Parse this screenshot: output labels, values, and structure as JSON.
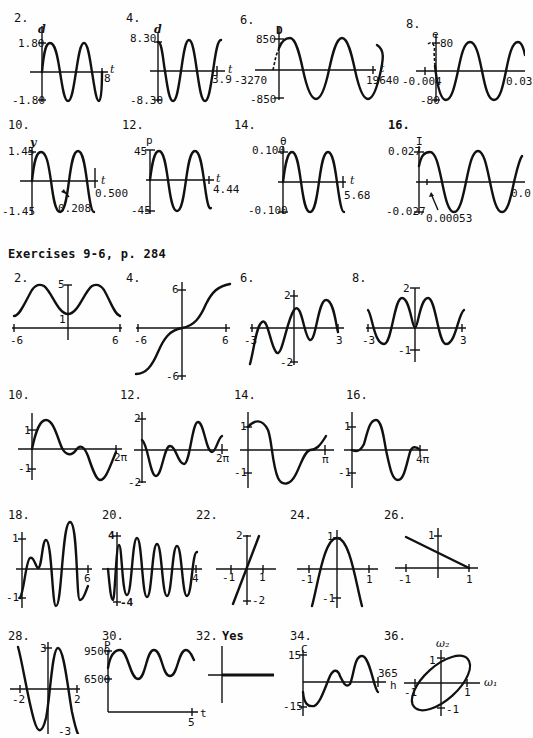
{
  "section_title": "Exercises 9-6, p. 284",
  "top_group": [
    {
      "num": "2.",
      "yvar": "d",
      "xvar": "t",
      "ymax": "1.80",
      "ymin": "-1.80",
      "xmax": "8"
    },
    {
      "num": "4.",
      "yvar": "d",
      "xvar": "t",
      "ymax": "8.30",
      "ymin": "-8.30",
      "xmax": "3.9"
    },
    {
      "num": "6.",
      "yvar": "D",
      "xvar": "t",
      "ymax": "850",
      "ymin": "-850",
      "xmin": "-3270",
      "xmax": "19640"
    },
    {
      "num": "8.",
      "yvar": "e",
      "ymax": "80",
      "ymin": "-80",
      "xmin": "-0.004",
      "xmax": "0.03"
    },
    {
      "num": "10.",
      "yvar": "y",
      "xvar": "t",
      "ymax": "1.45",
      "ymin": "-1.45",
      "xmax": "0.500",
      "annotation": "0.208"
    },
    {
      "num": "12.",
      "yvar": "p",
      "xvar": "t",
      "ymax": "45",
      "ymin": "-45",
      "xmax": "4.44"
    },
    {
      "num": "14.",
      "yvar": "θ",
      "xvar": "t",
      "ymax": "0.100",
      "ymin": "-0.100",
      "xmax": "5.68"
    },
    {
      "num": "16.",
      "yvar": "I",
      "xvar": "t",
      "ymax": "0.027",
      "ymin": "-0.027",
      "xmax": "0.0",
      "annotation": "0.00053"
    }
  ],
  "exercises_9_6": [
    {
      "num": "2.",
      "ytop": "5",
      "ylow": "1",
      "xmin": "-6",
      "xmax": "6"
    },
    {
      "num": "4.",
      "ytop": "6",
      "ybot": "-6",
      "xmin": "-6",
      "xmax": "6"
    },
    {
      "num": "6.",
      "ytop": "2",
      "ybot": "-2",
      "xmin": "-3",
      "xmax": "3"
    },
    {
      "num": "8.",
      "ytop": "2",
      "ybot": "-1",
      "xmin": "-3",
      "xmax": "3"
    },
    {
      "num": "10.",
      "ytop": "1",
      "ybot": "-1",
      "xmax": "2π"
    },
    {
      "num": "12.",
      "ytop": "2",
      "ybot": "-2",
      "xmax": "2π"
    },
    {
      "num": "14.",
      "ytop": "1",
      "ybot": "-1",
      "xmax": "π"
    },
    {
      "num": "16.",
      "ytop": "1",
      "ybot": "-1",
      "xmax": "4π"
    },
    {
      "num": "18.",
      "ytop": "1",
      "ybot": "-1",
      "xmax": "6"
    },
    {
      "num": "20.",
      "ytop": "4",
      "ybot": "-4",
      "xmax": "4"
    },
    {
      "num": "22.",
      "ytop": "2",
      "ybot": "-2",
      "xmin": "-1",
      "xmax": "1"
    },
    {
      "num": "24.",
      "ytop": "1",
      "ybot": "-1",
      "xmin": "-1",
      "xmax": "1"
    },
    {
      "num": "26.",
      "ytop": "1",
      "xmin": "-1",
      "xmax": "1"
    },
    {
      "num": "28.",
      "ytop": "3",
      "ybot": "-3",
      "xmin": "-2",
      "xmax": "2"
    },
    {
      "num": "30.",
      "yvar": "P",
      "xvar": "t",
      "yhigh": "9500",
      "ylow": "6500",
      "xmax": "5"
    },
    {
      "num": "32.",
      "answer": "Yes"
    },
    {
      "num": "34.",
      "yvar": "C",
      "xvar": "h",
      "ytop": "15",
      "ybot": "-15",
      "xmax": "365"
    },
    {
      "num": "36.",
      "yvar": "ω₂",
      "xvar": "ω₁",
      "ytop": "1",
      "ybot": "-1",
      "xmin": "-1",
      "xmax": "1"
    }
  ]
}
